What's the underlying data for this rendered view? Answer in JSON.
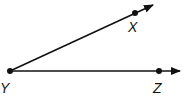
{
  "diagram": {
    "type": "angle",
    "name": "angle XYZ",
    "vertex": {
      "label": "Y",
      "x": 10,
      "y": 71
    },
    "rays": [
      {
        "name": "ray YX",
        "through": {
          "label": "X",
          "x": 135,
          "y": 13
        },
        "tip": {
          "x": 154,
          "y": 4
        }
      },
      {
        "name": "ray YZ",
        "through": {
          "label": "Z",
          "x": 159,
          "y": 71
        },
        "tip": {
          "x": 181,
          "y": 71
        }
      }
    ],
    "labels": {
      "X": "X",
      "Y": "Y",
      "Z": "Z"
    },
    "colors": {
      "stroke": "#111111",
      "background": "#ffffff"
    }
  }
}
